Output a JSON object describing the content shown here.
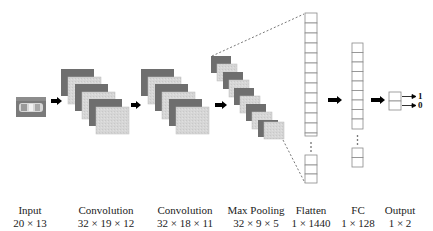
{
  "diagram": {
    "type": "cnn-architecture",
    "colors": {
      "dark_map": "#6e6e6e",
      "light_map": "#d4d4d4",
      "cell_stroke": "#8a8a8a",
      "arrow": "#000000",
      "text": "#222222"
    },
    "layers": [
      {
        "id": "input",
        "name": "Input",
        "dims": "20 × 13",
        "center_x": 30
      },
      {
        "id": "conv1",
        "name": "Convolution",
        "dims": "32 × 19 × 12",
        "center_x": 106
      },
      {
        "id": "conv2",
        "name": "Convolution",
        "dims": "32 × 18 × 11",
        "center_x": 185
      },
      {
        "id": "maxpool",
        "name": "Max Pooling",
        "dims": "32 × 9 × 5",
        "center_x": 256
      },
      {
        "id": "flatten",
        "name": "Flatten",
        "dims": "1 × 1440",
        "center_x": 311
      },
      {
        "id": "fc",
        "name": "FC",
        "dims": "1 × 128",
        "center_x": 358
      },
      {
        "id": "output",
        "name": "Output",
        "dims": "1 × 2",
        "center_x": 399
      }
    ],
    "output_values": [
      "1",
      "0"
    ],
    "ellipsis": "⋮"
  }
}
